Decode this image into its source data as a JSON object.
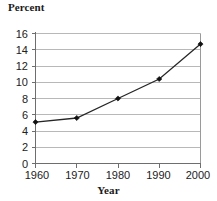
{
  "chart_data": {
    "type": "line",
    "title": "Percent",
    "xlabel": "Year",
    "ylabel": "Percent",
    "categories": [
      "1960",
      "1970",
      "1980",
      "1990",
      "2000"
    ],
    "x": [
      1960,
      1970,
      1980,
      1990,
      2000
    ],
    "values": [
      5.1,
      5.6,
      8.0,
      10.4,
      14.7
    ],
    "series": [
      {
        "name": "Percent",
        "values": [
          5.1,
          5.6,
          8.0,
          10.4,
          14.7
        ]
      }
    ],
    "xlim": [
      1960,
      2000
    ],
    "ylim": [
      0,
      16
    ],
    "y_ticks": [
      "0",
      "2",
      "4",
      "6",
      "8",
      "10",
      "12",
      "14",
      "16"
    ],
    "y_tick_values": [
      0,
      2,
      4,
      6,
      8,
      10,
      12,
      14,
      16
    ],
    "x_ticks": [
      "1960",
      "1970",
      "1980",
      "1990",
      "2000"
    ],
    "grid": true,
    "grid_axis": "y",
    "legend": false,
    "legend_position": "none",
    "marker": "diamond",
    "line_color": "#262626",
    "marker_color": "#111111",
    "grid_color": "#b8b8b8",
    "axis_color": "#6e6e6e",
    "background_color": "#ffffff"
  }
}
